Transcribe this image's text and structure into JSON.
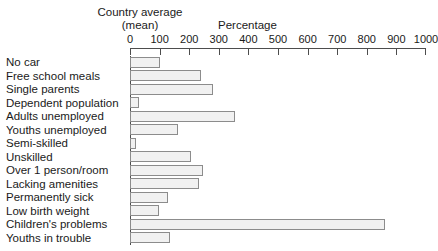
{
  "header": {
    "left_title_line1": "Country average",
    "left_title_line2": "(mean)",
    "right_title": "Percentage"
  },
  "chart_data": {
    "type": "bar",
    "orientation": "horizontal",
    "title": "",
    "xlabel": "Percentage",
    "ylabel": "",
    "xlim": [
      0,
      1000
    ],
    "grid": false,
    "legend": null,
    "tick_labels": [
      "0",
      "100",
      "200",
      "300",
      "400",
      "500",
      "600",
      "700",
      "800",
      "900",
      "1000"
    ],
    "ticks": [
      0,
      100,
      200,
      300,
      400,
      500,
      600,
      700,
      800,
      900,
      1000
    ],
    "categories": [
      "No car",
      "Free school meals",
      "Single parents",
      "Dependent population",
      "Adults unemployed",
      "Youths unemployed",
      "Semi-skilled",
      "Unskilled",
      "Over 1 person/room",
      "Lacking amenities",
      "Permanently sick",
      "Low birth weight",
      "Children's problems",
      "Youths in trouble"
    ],
    "values": [
      100,
      240,
      280,
      30,
      355,
      163,
      20,
      205,
      247,
      233,
      128,
      98,
      860,
      135
    ],
    "bar_fill": "#f1f1f1",
    "bar_border": "#8c8c8c",
    "axis_color": "#4d4d4d"
  }
}
